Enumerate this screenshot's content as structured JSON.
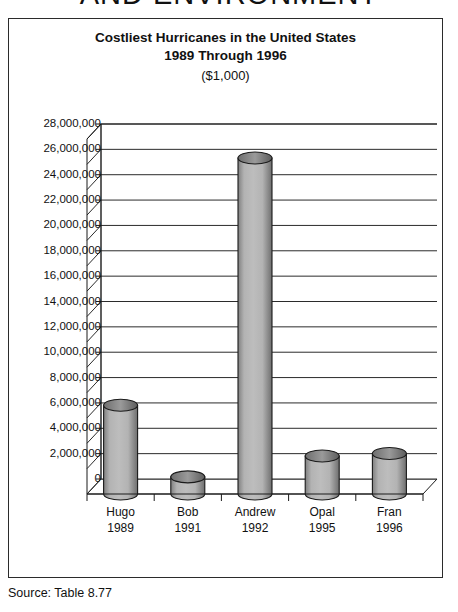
{
  "page": {
    "running_head": "AND ENVIRONMENT",
    "source_note": "Source:  Table 8.77"
  },
  "chart_data": {
    "type": "bar",
    "title": "Costliest Hurricanes in the United States",
    "title_line2": "1989 Through 1996",
    "subtitle": "($1,000)",
    "xlabel": "",
    "ylabel": "",
    "categories": [
      "Hugo",
      "Bob",
      "Andrew",
      "Opal",
      "Fran"
    ],
    "category_years": [
      "1989",
      "1991",
      "1992",
      "1995",
      "1996"
    ],
    "values": [
      7000000,
      1350000,
      26500000,
      3000000,
      3200000
    ],
    "ylim": [
      0,
      28000000
    ],
    "ytick_labels": [
      "28,000,000",
      "26,000,000",
      "24,000,000",
      "22,000,000",
      "20,000,000",
      "18,000,000",
      "16,000,000",
      "14,000,000",
      "12,000,000",
      "10,000,000",
      "8,000,000",
      "6,000,000",
      "4,000,000",
      "2,000,000",
      "0"
    ],
    "ytick_values": [
      28000000,
      26000000,
      24000000,
      22000000,
      20000000,
      18000000,
      16000000,
      14000000,
      12000000,
      10000000,
      8000000,
      6000000,
      4000000,
      2000000,
      0
    ],
    "grid": true,
    "legend": false,
    "legend_position": "none",
    "style": "3d-cylinder",
    "colors": {
      "bar_fill_light": "#b3b3b3",
      "bar_fill_dark": "#808080",
      "bar_outline": "#1a1a1a",
      "grid_line": "#2b2b2b",
      "axis_line": "#1a1a1a",
      "frame_border": "#2b2b2b",
      "background": "#ffffff",
      "text": "#111111"
    }
  }
}
